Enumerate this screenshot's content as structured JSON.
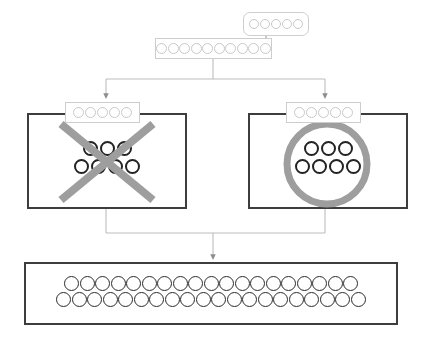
{
  "diagram": {
    "type": "flowchart",
    "background_color": "#ffffff",
    "palette": {
      "box_border_strong": "#3d3d3d",
      "box_border_light": "#cdcdcd",
      "token_light_border": "#c9c9c9",
      "token_dark_border": "#232323",
      "overlay_gray": "#9e9e9e",
      "connector_gray": "#b4b4b4",
      "arrowhead_gray": "#8d8d8d"
    },
    "nodes": [
      {
        "id": "top-right-bubble",
        "name": "callout-token-box",
        "shape": "rounded-rectangle",
        "border": "light",
        "token_rows": [
          5
        ],
        "token_style": "light",
        "x": 243,
        "y": 12,
        "w": 66,
        "h": 24
      },
      {
        "id": "source-sequence",
        "name": "source-sequence-box",
        "shape": "rectangle",
        "border": "light",
        "token_rows": [
          10
        ],
        "token_style": "light",
        "x": 155,
        "y": 38,
        "w": 117,
        "h": 21
      },
      {
        "id": "left-branch",
        "name": "rejected-branch-box",
        "shape": "rectangle",
        "border": "strong",
        "overlay": "x-mark",
        "overlay_label": "rejected",
        "token_rows": [
          3,
          4
        ],
        "token_style": "dark",
        "x": 27,
        "y": 113,
        "w": 160,
        "h": 96,
        "header": {
          "name": "branch-header-box",
          "token_rows": [
            5
          ],
          "token_style": "light",
          "x": 65,
          "y": 102,
          "w": 75,
          "h": 21
        }
      },
      {
        "id": "right-branch",
        "name": "accepted-branch-box",
        "shape": "rectangle",
        "border": "strong",
        "overlay": "o-mark",
        "overlay_label": "accepted",
        "token_rows": [
          3,
          4
        ],
        "token_style": "dark",
        "x": 248,
        "y": 113,
        "w": 160,
        "h": 96,
        "header": {
          "name": "branch-header-box",
          "token_rows": [
            5
          ],
          "token_style": "light",
          "x": 286,
          "y": 102,
          "w": 75,
          "h": 21
        }
      },
      {
        "id": "output-sequence",
        "name": "output-sequence-box",
        "shape": "rectangle",
        "border": "strong",
        "token_rows": [
          19,
          20
        ],
        "token_style": "mid",
        "x": 24,
        "y": 262,
        "w": 374,
        "h": 63
      }
    ],
    "connectors": [
      {
        "id": "callout-to-source",
        "name": "callout-connector",
        "from": "top-right-bubble",
        "to": "source-sequence",
        "style": "elbow-hook",
        "arrowhead": false
      },
      {
        "id": "source-to-left",
        "name": "branch-connector-left",
        "from": "source-sequence",
        "to": "left-branch",
        "style": "tree-split",
        "arrowhead": true
      },
      {
        "id": "source-to-right",
        "name": "branch-connector-right",
        "from": "source-sequence",
        "to": "right-branch",
        "style": "tree-split",
        "arrowhead": true
      },
      {
        "id": "branches-to-output",
        "name": "merge-connector",
        "from": "left-branch,right-branch",
        "to": "output-sequence",
        "style": "tree-merge",
        "arrowhead": true
      }
    ]
  }
}
